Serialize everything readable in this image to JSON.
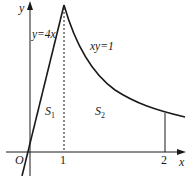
{
  "diagram": {
    "title": "",
    "axes": {
      "x_label": "x",
      "y_label": "y",
      "origin_label": "O",
      "x_ticks": [
        "1",
        "2"
      ]
    },
    "curves": [
      {
        "name": "line",
        "label": "y=4x"
      },
      {
        "name": "hyperbola",
        "label": "xy=1"
      }
    ],
    "regions": [
      {
        "name": "S1",
        "base": "S",
        "sub": "1"
      },
      {
        "name": "S2",
        "base": "S",
        "sub": "2"
      }
    ],
    "colors": {
      "stroke": "#1a1a1a",
      "background": "#ffffff"
    }
  }
}
